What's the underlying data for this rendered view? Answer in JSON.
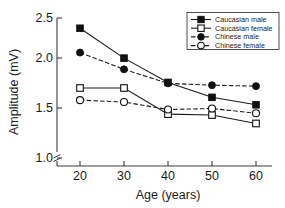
{
  "chart_data": {
    "type": "line",
    "title": "",
    "xlabel": "Age (years)",
    "ylabel": "Amplitude (mV)",
    "x": [
      20,
      30,
      40,
      50,
      60
    ],
    "xticklabels": [
      "20",
      "30",
      "40",
      "50",
      "60"
    ],
    "yticklabels": [
      "1.0",
      "1.5",
      "2.0",
      "2.5"
    ],
    "yticks": [
      1.0,
      1.5,
      2.0,
      2.5
    ],
    "xlim": [
      15,
      65
    ],
    "ylim": [
      1.0,
      2.5
    ],
    "grid": false,
    "axis_break": true,
    "legend_position": "top-right",
    "series": [
      {
        "name": "Caucasian male",
        "marker": "filled-square",
        "linestyle": "solid",
        "color": "#111111",
        "values": [
          2.39,
          2.07,
          1.81,
          1.65,
          1.57
        ]
      },
      {
        "name": "Caucasian female",
        "marker": "open-square",
        "linestyle": "solid",
        "color": "#111111",
        "values": [
          1.75,
          1.75,
          1.47,
          1.46,
          1.37
        ]
      },
      {
        "name": "Chinese male",
        "marker": "filled-circle",
        "linestyle": "dashed",
        "color": "#111111",
        "values": [
          2.13,
          1.95,
          1.8,
          1.78,
          1.77
        ]
      },
      {
        "name": "Chinese female",
        "marker": "open-circle",
        "linestyle": "dashed",
        "color": "#111111",
        "values": [
          1.62,
          1.6,
          1.52,
          1.53,
          1.48
        ]
      }
    ]
  },
  "axes": {
    "y_title": "Amplitude (mV)",
    "x_title": "Age (years)",
    "y_tick_1": "1.0",
    "y_tick_2": "1.5",
    "y_tick_3": "2.0",
    "y_tick_4": "2.5",
    "x_tick_1": "20",
    "x_tick_2": "30",
    "x_tick_3": "40",
    "x_tick_4": "50",
    "x_tick_5": "60"
  },
  "legend": {
    "entry_1": "Caucasian male",
    "entry_2": "Caucasian female",
    "entry_3": "Chinese male",
    "entry_4": "Chinese female"
  }
}
